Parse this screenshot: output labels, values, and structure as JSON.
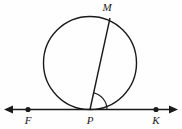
{
  "figure": {
    "type": "geometry-diagram",
    "background_color": "#fefefe",
    "stroke_color": "#1a1a1a",
    "labels": [
      {
        "id": "M",
        "text": "M",
        "x": 107,
        "y": 11,
        "role": "point-label-on-circle"
      },
      {
        "id": "F",
        "text": "F",
        "x": 28,
        "y": 124,
        "role": "point-label-on-line"
      },
      {
        "id": "P",
        "text": "P",
        "x": 90,
        "y": 124,
        "role": "tangent-point-label"
      },
      {
        "id": "K",
        "text": "K",
        "x": 156,
        "y": 124,
        "role": "point-label-on-line"
      }
    ],
    "circle": {
      "cx": 90,
      "cy": 63,
      "r": 46.5
    },
    "chord": {
      "x1": 110,
      "y1": 18,
      "x2": 90,
      "y2": 109.5,
      "from": "M",
      "to": "P"
    },
    "line": {
      "y": 109.5,
      "x_start": 5,
      "x_end": 177,
      "arrow_left": true,
      "arrow_right": true
    },
    "dots": [
      {
        "id": "F",
        "cx": 28,
        "cy": 109.5,
        "r": 2.6
      },
      {
        "id": "K",
        "cx": 156,
        "cy": 109.5,
        "r": 2.6
      }
    ],
    "angle_arc": {
      "vertex_x": 90,
      "vertex_y": 109.5,
      "radius": 17,
      "from_ray": "PM",
      "to_ray": "PK"
    }
  }
}
